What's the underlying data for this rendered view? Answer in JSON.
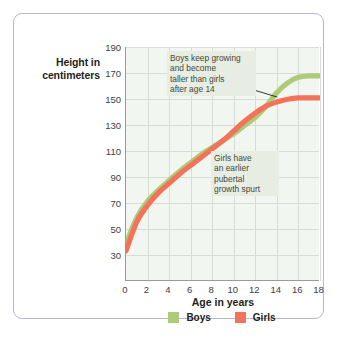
{
  "chart_data": {
    "type": "line",
    "title": "",
    "xlabel": "Age in years",
    "ylabel": "Height in centimeters",
    "ylabel_line1": "Height in",
    "ylabel_line2": "centimeters",
    "xlim": [
      0,
      18
    ],
    "ylim": [
      30,
      200
    ],
    "xticks": [
      "0",
      "2",
      "4",
      "6",
      "8",
      "10",
      "12",
      "14",
      "16",
      "18"
    ],
    "yticks": [
      "190",
      "170",
      "150",
      "130",
      "110",
      "90",
      "70",
      "50",
      "30"
    ],
    "grid": true,
    "legend_position": "bottom-center",
    "x": [
      0,
      1,
      2,
      3,
      4,
      5,
      6,
      7,
      8,
      9,
      10,
      11,
      12,
      13,
      14,
      15,
      16,
      17,
      18
    ],
    "series": [
      {
        "name": "Boys",
        "color": "#aecc78",
        "values": [
          57,
          76,
          88,
          96,
          103,
          110,
          116,
          122,
          127,
          132,
          137,
          143,
          149,
          157,
          167,
          174,
          178,
          179,
          179
        ]
      },
      {
        "name": "Girls",
        "color": "#f2735a",
        "values": [
          52,
          73,
          85,
          94,
          101,
          108,
          114,
          120,
          126,
          132,
          139,
          146,
          152,
          157,
          160,
          162,
          163,
          163,
          163
        ]
      }
    ],
    "annotations": [
      {
        "name": "boys-note",
        "text": "Boys keep growing\nand become\ntaller than girls\nafter age 14",
        "points_to_age": 15.5
      },
      {
        "name": "girls-note",
        "text": "Girls have\nan earlier\npubertal\ngrowth spurt",
        "points_to_age": 12.5
      }
    ]
  },
  "legend": {
    "items": [
      {
        "label": "Boys",
        "color": "#aecc78"
      },
      {
        "label": "Girls",
        "color": "#f2735a"
      }
    ]
  },
  "colors": {
    "boys": "#aecc78",
    "girls": "#f2735a",
    "plot_background": "#f2f6f0",
    "gridline": "#d8dcd8",
    "card_border": "#b7b6d4",
    "annotation_background": "#e7ede2"
  }
}
